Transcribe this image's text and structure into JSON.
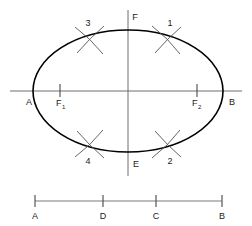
{
  "figure": {
    "background_color": "#ffffff",
    "ink_color": "#000000",
    "axis_color": "#6e6e6e",
    "arc_color": "#555555"
  },
  "ellipse": {
    "center": {
      "x": 128,
      "y": 91
    },
    "semi_major_a": 95,
    "semi_minor_b": 61,
    "vertex_left_label": "A",
    "vertex_right_label": "B",
    "vertex_top_label": "F",
    "vertex_bottom_label": "E"
  },
  "axis_labels": {
    "major_left": "A",
    "major_right": "B",
    "minor_top": "F",
    "minor_bottom": "E",
    "focus_left": "F",
    "focus_left_sub": "1",
    "focus_right": "F",
    "focus_right_sub": "2"
  },
  "foci": {
    "left": {
      "x": 60,
      "y": 91
    },
    "right": {
      "x": 197,
      "y": 91
    }
  },
  "arc_marks": [
    {
      "label": "1",
      "x": 168,
      "y": 38,
      "label_x": 170,
      "label_y": 26,
      "angle": -35
    },
    {
      "label": "2",
      "x": 168,
      "y": 146,
      "label_x": 170,
      "label_y": 162,
      "angle": 35
    },
    {
      "label": "3",
      "x": 90,
      "y": 38,
      "label_x": 85,
      "label_y": 26,
      "angle": 35
    },
    {
      "label": "4",
      "x": 90,
      "y": 146,
      "label_x": 85,
      "label_y": 162,
      "angle": -35
    }
  ],
  "scale_bar": {
    "y": 201,
    "start_x": 35,
    "end_x": 222,
    "ticks": [
      {
        "label": "A",
        "x": 35
      },
      {
        "label": "D",
        "x": 103
      },
      {
        "label": "C",
        "x": 156
      },
      {
        "label": "B",
        "x": 222
      }
    ],
    "label_y": 216
  }
}
